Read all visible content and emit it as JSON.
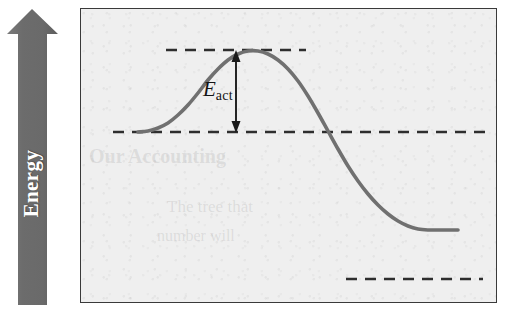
{
  "figure": {
    "width": 510,
    "height": 320,
    "background_color": "#ffffff"
  },
  "axis": {
    "label": "Energy",
    "direction": "up",
    "arrow_color": "#6e6e6e",
    "label_color": "#ffffff",
    "icon": "up-arrow-icon"
  },
  "plot": {
    "background_color": "#efefef",
    "border_color": "#3a3a3a",
    "curve_color": "#707070",
    "dashed_color": "#2e2e2e",
    "annotation_color": "#141414"
  },
  "annotation": {
    "symbol": "E",
    "subscript": "act",
    "full_text": "Eact",
    "arrow_type": "double-headed-vertical"
  },
  "ghost": {
    "line1": "Our Accounting",
    "line2": "The tree that",
    "line3": "number will"
  },
  "chart_data": {
    "type": "line",
    "title": "",
    "xlabel": "",
    "ylabel": "Energy",
    "xlim": [
      0,
      417
    ],
    "ylim": [
      0,
      295
    ],
    "grid": false,
    "legend": null,
    "series": [
      {
        "name": "reaction-energy-profile",
        "color": "#707070",
        "points": [
          [
            57,
            123
          ],
          [
            67,
            122
          ],
          [
            77,
            119
          ],
          [
            87,
            114
          ],
          [
            97,
            106
          ],
          [
            107,
            96
          ],
          [
            117,
            84
          ],
          [
            127,
            71
          ],
          [
            137,
            60
          ],
          [
            147,
            51
          ],
          [
            157,
            45
          ],
          [
            167,
            42
          ],
          [
            177,
            42
          ],
          [
            187,
            45
          ],
          [
            197,
            51
          ],
          [
            207,
            60
          ],
          [
            217,
            72
          ],
          [
            227,
            87
          ],
          [
            237,
            104
          ],
          [
            247,
            122
          ],
          [
            257,
            140
          ],
          [
            267,
            157
          ],
          [
            277,
            172
          ],
          [
            287,
            185
          ],
          [
            297,
            196
          ],
          [
            307,
            205
          ],
          [
            317,
            212
          ],
          [
            327,
            217
          ],
          [
            337,
            220
          ],
          [
            347,
            221
          ],
          [
            357,
            221
          ],
          [
            367,
            221
          ],
          [
            377,
            221
          ]
        ]
      }
    ],
    "levels": [
      {
        "name": "transition-state-level",
        "label": "",
        "y": 41,
        "x_start": 85,
        "x_end": 225,
        "style": "dashed"
      },
      {
        "name": "reactant-level",
        "label": "",
        "y": 123,
        "x_start": 32,
        "x_end": 405,
        "style": "dashed"
      },
      {
        "name": "product-level",
        "label": "",
        "y": 270,
        "x_start": 265,
        "x_end": 402,
        "style": "dashed"
      }
    ],
    "annotations": [
      {
        "name": "activation-energy-arrow",
        "text": "Eact",
        "x": 155,
        "y_top": 42,
        "y_bottom": 123,
        "value_description": "activation energy, from reactant level up to transition state"
      }
    ]
  }
}
